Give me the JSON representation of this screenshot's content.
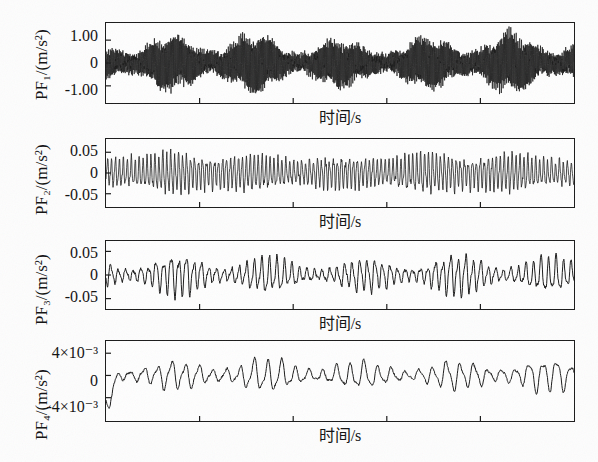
{
  "figure": {
    "title": "",
    "background": "#fdfdfd",
    "ink": "#1a1a1a",
    "panel_count": 4
  },
  "chart_data": [
    {
      "type": "line",
      "name": "PF1",
      "title": "",
      "ylabel": "PF₁/(m/s²)",
      "xlabel": "时间/s",
      "ytick_labels": [
        "1.00",
        "0",
        "-1.00"
      ],
      "ytick_values": [
        1.0,
        0,
        -1.0
      ],
      "ylim": [
        -1.75,
        1.75
      ],
      "xlim": [
        0,
        1
      ],
      "xtick_count": 4,
      "grid": false,
      "legend": "none",
      "description": "dense amplitude-modulated carrier, very high frequency, ~5.5 beat envelopes across the record",
      "carrier_cycles": 520,
      "envelope_cycles": 5.5,
      "envelope_min": 0.34,
      "envelope_max": 1.0,
      "peak_amplitude": 1.45,
      "noise": 0.12,
      "seed": 17
    },
    {
      "type": "line",
      "name": "PF2",
      "title": "",
      "ylabel": "PF₂/(m/s²)",
      "xlabel": "时间/s",
      "ytick_labels": [
        "0.05",
        "0",
        "-0.05"
      ],
      "ytick_values": [
        0.05,
        0,
        -0.05
      ],
      "ylim": [
        -0.082,
        0.082
      ],
      "xlim": [
        0,
        1
      ],
      "xtick_count": 4,
      "grid": false,
      "legend": "none",
      "description": "near-uniform high-frequency oscillation with mild amplitude variation",
      "carrier_cycles": 118,
      "envelope_cycles": 5.5,
      "envelope_min": 0.72,
      "envelope_max": 1.0,
      "peak_amplitude": 0.062,
      "noise": 0.1,
      "seed": 41
    },
    {
      "type": "line",
      "name": "PF3",
      "title": "",
      "ylabel": "PF₃/(m/s²)",
      "xlabel": "时间/s",
      "ytick_labels": [
        "0.05",
        "0",
        "-0.05"
      ],
      "ytick_values": [
        0.05,
        0,
        -0.05
      ],
      "ylim": [
        -0.072,
        0.072
      ],
      "xlim": [
        0,
        1
      ],
      "xtick_count": 4,
      "grid": false,
      "legend": "none",
      "description": "clearly amplitude-modulated oscillation alternating between large and small groups",
      "carrier_cycles": 62,
      "envelope_cycles": 5.0,
      "envelope_min": 0.3,
      "envelope_max": 1.0,
      "peak_amplitude": 0.055,
      "noise": 0.06,
      "seed": 7
    },
    {
      "type": "line",
      "name": "PF4",
      "title": "",
      "ylabel": "PF₄/(m/s²)",
      "xlabel": "时间/s",
      "ytick_labels": [
        "4×10⁻³",
        "0",
        "-4×10⁻³"
      ],
      "ytick_values": [
        0.004,
        0,
        -0.004
      ],
      "ylim": [
        -0.0082,
        0.0062
      ],
      "xlim": [
        0,
        1
      ],
      "xtick_count": 4,
      "grid": false,
      "legend": "none",
      "description": "low-frequency wave with five repeating bursts; large negative excursion at the very start",
      "carrier_cycles": 34,
      "envelope_cycles": 5.0,
      "envelope_min": 0.35,
      "envelope_max": 1.0,
      "peak_amplitude": 0.0038,
      "noise": 0.05,
      "seed": 93,
      "start_dip": -0.0082
    }
  ]
}
